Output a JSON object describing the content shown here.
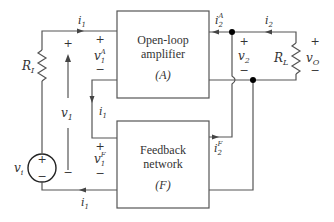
{
  "diagram": {
    "blocks": {
      "amplifier": {
        "line1": "Open-loop",
        "line2": "amplifier",
        "symbol": "(A)"
      },
      "feedback": {
        "line1": "Feedback",
        "line2": "network",
        "symbol": "(F)"
      }
    },
    "components": {
      "source_resistor": "R",
      "source_resistor_sub": "I",
      "load_resistor": "R",
      "load_resistor_sub": "L",
      "source": "v",
      "source_sub": "i",
      "source_plus": "+",
      "source_minus": "−"
    },
    "currents": {
      "i1_top": {
        "base": "i",
        "sub": "1"
      },
      "i1_mid": {
        "base": "i",
        "sub": "1"
      },
      "i1_bottom": {
        "base": "i",
        "sub": "1"
      },
      "i2": {
        "base": "i",
        "sub": "2"
      },
      "i2A": {
        "base": "i",
        "sub": "2",
        "sup": "A"
      },
      "i2F": {
        "base": "i",
        "sub": "2",
        "sup": "F"
      }
    },
    "voltages": {
      "v1": {
        "base": "v",
        "sub": "1",
        "plus": "+",
        "minus": "−"
      },
      "v1A": {
        "base": "v",
        "sub": "1",
        "sup": "A",
        "plus": "+",
        "minus": "−"
      },
      "v1F": {
        "base": "v",
        "sub": "1",
        "sup": "F",
        "plus": "+",
        "minus": "−"
      },
      "v2": {
        "base": "v",
        "sub": "2",
        "plus": "+",
        "minus": "−"
      },
      "vO": {
        "base": "v",
        "sub": "O",
        "plus": "+",
        "minus": "−"
      }
    },
    "colors": {
      "wire": "#555555",
      "text": "#333333",
      "node": "#000000"
    }
  }
}
